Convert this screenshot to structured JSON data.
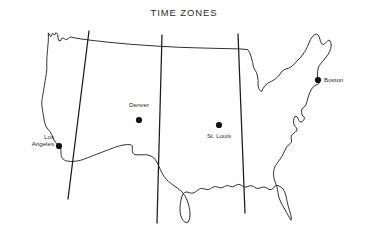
{
  "figure": {
    "title": "TIME ZONES",
    "background_color": "#ffffff",
    "line_color": "#1a1a1a",
    "text_color": "#2b2b2b"
  },
  "cities": [
    {
      "name": "Los Angeles",
      "label_line1": "Los",
      "label_line2": "Angeles",
      "x": 59,
      "y": 146
    },
    {
      "name": "Denver",
      "label_line1": "Denver",
      "label_line2": "",
      "x": 139,
      "y": 120
    },
    {
      "name": "St. Louis",
      "label_line1": "St. Louis",
      "label_line2": "",
      "x": 219,
      "y": 125
    },
    {
      "name": "Boston",
      "label_line1": "Boston",
      "label_line2": "",
      "x": 318,
      "y": 80
    }
  ],
  "time_zone_lines": [
    {
      "name": "pacific-mountain-boundary",
      "x_top": 89,
      "y_top": 31,
      "x_bottom": 68,
      "y_bottom": 199
    },
    {
      "name": "mountain-central-boundary",
      "x_top": 162,
      "y_top": 35,
      "x_bottom": 157,
      "y_bottom": 223
    },
    {
      "name": "central-eastern-boundary",
      "x_top": 238,
      "y_top": 34,
      "x_bottom": 245,
      "y_bottom": 213
    }
  ],
  "map": {
    "region_name": "Contiguous United States",
    "outline_path": "M 48.5 33.2 L 50.8 36.6 L 52.5 33.4 L 54.6 35.0 L 56.0 32.6 L 57.6 34.4 L 58.4 40.2 L 60.4 41.0 L 61.4 38.6 L 63.6 38.0 L 65.4 39.8 L 68.4 38.6 L 70.0 36.9 L 73.2 37.6 L 80.0 38.8 L 92.0 40.4 L 110.0 42.4 L 132.0 44.4 L 158.0 46.2 L 182.0 47.4 L 205.0 48.1 L 226.0 48.6 L 240.0 48.9 L 247.5 49.6 L 249.6 52.4 L 251.2 57.0 L 252.6 62.5 L 253.4 66.8 L 255.0 70.2 L 256.6 72.6 L 257.4 76.0 L 258.2 80.6 L 258.0 84.8 L 258.6 88.4 L 260.0 90.6 L 261.6 91.4 L 263.0 88.6 L 265.0 85.6 L 268.2 83.0 L 271.6 81.2 L 274.8 79.4 L 277.6 77.0 L 280.0 74.0 L 282.4 71.0 L 285.2 69.2 L 288.8 68.2 L 292.0 66.2 L 295.0 63.2 L 298.0 60.0 L 300.8 57.2 L 303.2 54.0 L 305.4 50.6 L 307.4 46.6 L 309.0 42.8 L 310.6 39.4 L 312.4 36.6 L 314.6 34.8 L 316.8 34.0 L 318.4 35.4 L 319.6 38.0 L 320.4 41.2 L 321.6 43.8 L 323.4 44.6 L 325.2 43.4 L 326.8 41.6 L 328.2 40.2 L 329.8 40.6 L 330.8 42.4 L 331.2 45.0 L 330.8 48.2 L 329.6 51.6 L 327.8 54.8 L 325.6 57.8 L 323.4 60.6 L 321.2 63.0 L 319.4 65.4 L 318.2 68.2 L 317.6 71.6 L 317.4 75.2 L 317.8 78.4 L 318.6 80.8 L 319.4 82.6 L 318.2 84.2 L 316.0 85.0 L 313.6 86.6 L 311.6 89.0 L 310.0 92.0 L 308.8 95.2 L 307.8 98.4 L 307.0 101.4 L 306.2 104.0 L 305.0 106.2 L 303.6 107.4 L 302.4 108.2 L 301.6 110.2 L 301.6 112.8 L 302.2 115.0 L 303.2 116.4 L 304.2 117.0 L 304.4 118.6 L 303.6 120.2 L 302.4 121.4 L 301.0 122.0 L 299.6 121.6 L 298.6 120.2 L 298.0 118.4 L 297.2 117.0 L 296.0 116.2 L 294.8 116.6 L 294.0 118.4 L 293.6 120.8 L 293.6 123.2 L 294.2 125.2 L 295.2 126.6 L 296.4 127.6 L 297.0 129.2 L 296.4 131.0 L 295.0 132.4 L 293.4 133.4 L 292.0 134.8 L 291.2 136.8 L 291.2 139.0 L 291.6 141.0 L 291.2 142.6 L 290.0 143.8 L 288.4 145.0 L 286.8 146.8 L 285.6 149.0 L 284.4 151.4 L 283.2 154.0 L 281.8 156.6 L 280.2 159.0 L 278.6 161.2 L 277.0 163.4 L 275.4 165.8 L 274.2 168.6 L 273.6 171.8 L 273.6 175.2 L 274.0 178.4 L 274.8 181.2 L 275.8 183.8 L 276.8 186.6 L 277.6 189.6 L 278.0 192.6 L 278.4 195.8 L 279.4 199.0 L 281.0 202.4 L 282.8 205.8 L 284.6 209.0 L 286.4 212.2 L 288.2 215.4 L 289.8 218.2 L 291.0 220.2 L 291.4 218.2 L 290.8 214.8 L 289.6 210.8 L 288.4 206.8 L 287.4 202.8 L 286.6 198.8 L 285.8 195.0 L 284.6 191.6 L 283.0 189.0 L 281.0 187.2 L 279.0 186.0 L 277.0 185.4 L 275.4 185.8 L 274.2 187.0 L 273.0 188.4 L 271.6 189.4 L 270.0 189.6 L 268.4 189.0 L 266.8 188.0 L 265.2 187.2 L 263.4 187.0 L 261.6 187.4 L 259.8 188.0 L 258.0 188.4 L 256.2 188.2 L 254.6 187.4 L 253.2 186.4 L 251.6 185.8 L 249.8 185.8 L 248.0 186.4 L 246.2 187.0 L 244.4 187.0 L 242.8 186.4 L 241.4 185.4 L 240.0 184.6 L 238.4 184.4 L 236.8 184.8 L 235.4 185.6 L 234.0 186.4 L 232.4 186.8 L 230.8 186.6 L 229.2 186.0 L 227.6 185.6 L 226.0 185.8 L 224.4 186.6 L 222.8 187.4 L 221.0 187.8 L 219.2 187.6 L 217.4 187.0 L 215.6 186.6 L 213.8 186.8 L 212.2 187.6 L 210.6 188.6 L 208.8 189.4 L 207.0 189.6 L 205.2 189.2 L 203.4 188.6 L 201.6 188.4 L 199.8 188.8 L 198.2 189.8 L 196.6 191.0 L 195.0 192.2 L 193.2 193.0 L 191.4 193.2 L 189.6 192.8 L 187.8 192.2 L 186.0 192.0 L 184.4 192.6 L 183.0 194.0 L 182.0 196.2 L 181.2 199.0 L 180.6 202.2 L 180.2 205.6 L 180.0 209.0 L 180.2 212.4 L 180.8 215.6 L 181.8 218.4 L 183.2 220.6 L 185.0 222.2 L 186.8 222.8 L 188.2 222.0 L 189.2 220.0 L 189.8 217.2 L 190.0 214.0 L 189.8 210.6 L 189.2 207.2 L 188.4 204.0 L 187.4 201.0 L 186.2 198.2 L 184.8 195.6 L 183.2 193.4 L 181.4 191.4 L 179.4 189.6 L 177.2 188.0 L 175.0 186.4 L 172.8 184.8 L 170.6 183.2 L 168.4 181.4 L 166.4 179.4 L 164.6 177.2 L 163.0 174.8 L 161.6 172.2 L 160.4 169.6 L 159.2 167.0 L 158.0 164.4 L 156.8 162.0 L 155.4 159.8 L 153.8 158.0 L 152.0 156.6 L 150.0 155.6 L 148.0 155.0 L 146.0 154.8 L 144.0 154.8 L 142.0 154.8 L 140.0 154.8 L 138.0 154.8 L 136.0 154.8 L 134.2 154.4 L 133.0 153.2 L 132.4 151.4 L 132.2 149.4 L 132.4 147.6 L 132.4 146.0 L 131.4 145.0 L 129.6 144.6 L 127.4 144.6 L 125.0 144.8 L 122.4 145.2 L 119.8 145.8 L 117.2 146.6 L 114.6 147.4 L 112.0 148.4 L 109.4 149.4 L 106.8 150.4 L 104.2 151.4 L 101.6 152.4 L 99.0 153.4 L 96.4 154.4 L 93.8 155.4 L 91.2 156.4 L 88.6 157.4 L 86.0 158.4 L 83.4 159.4 L 80.8 160.2 L 78.2 160.8 L 75.6 161.2 L 73.0 161.4 L 70.4 161.4 L 67.8 161.2 L 65.4 160.6 L 63.4 159.4 L 62.0 157.6 L 61.2 155.4 L 61.0 153.0 L 61.0 150.6 L 60.6 148.4 L 59.8 146.6 L 58.6 145.2 L 57.2 144.0 L 55.8 142.6 L 54.6 141.0 L 53.6 139.2 L 52.8 137.2 L 52.0 135.2 L 51.0 133.2 L 49.8 131.4 L 48.4 129.8 L 47.0 128.0 L 45.8 126.0 L 45.0 123.8 L 44.4 121.4 L 44.0 119.0 L 43.6 116.6 L 43.2 114.2 L 42.8 111.8 L 42.4 109.4 L 42.0 107.0 L 41.8 104.6 L 41.8 102.2 L 42.0 99.8 L 42.4 97.4 L 42.8 95.0 L 43.2 92.6 L 43.6 90.2 L 44.0 87.8 L 44.4 85.4 L 44.8 83.0 L 45.2 80.6 L 45.6 78.2 L 46.0 75.8 L 46.4 73.4 L 46.6 71.0 L 46.8 68.6 L 46.8 66.2 L 46.8 63.8 L 46.8 61.4 L 46.8 59.0 L 47.0 56.6 L 47.2 54.2 L 47.4 51.8 L 47.6 49.4 L 47.8 47.0 L 48.0 44.6 L 48.2 42.2 L 48.3 39.8 L 48.4 37.4 Z",
    "lake_detail_path": "M 301.8 111.6 L 303.4 113.0 L 303.0 115.0 L 301.8 115.4 L 300.8 114.2 L 300.8 112.4 Z"
  },
  "legend": {
    "zone_names": [
      "Pacific",
      "Mountain",
      "Central",
      "Eastern"
    ]
  }
}
